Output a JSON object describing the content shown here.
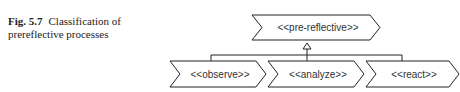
{
  "caption": {
    "number": "Fig. 5.7",
    "text": "Classification of prereflective processes"
  },
  "diagram": {
    "parent": {
      "label": "<<pre-reflective>>"
    },
    "children": [
      {
        "label": "<<observe>>"
      },
      {
        "label": "<<analyze>>"
      },
      {
        "label": "<<react>>"
      }
    ],
    "relation": "generalization",
    "colors": {
      "stroke": "#222222",
      "fill": "#ffffff",
      "text": "#333333"
    }
  }
}
